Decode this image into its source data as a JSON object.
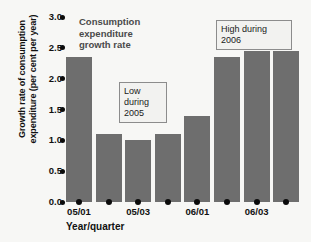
{
  "chart_data": {
    "type": "bar",
    "title": "",
    "series_label": "Consumption expenditure growth rate",
    "xlabel": "Year/quarter",
    "ylabel": "Growth rate of consumption expenditure (per cent per year)",
    "categories": [
      "05/01",
      "05/02",
      "05/03",
      "05/04",
      "06/01",
      "06/02",
      "06/03",
      "06/04"
    ],
    "tick_labels_shown": [
      "05/01",
      "05/03",
      "06/01",
      "06/03"
    ],
    "values": [
      2.35,
      1.1,
      1.0,
      1.1,
      1.4,
      2.35,
      2.45,
      2.45
    ],
    "ylim": [
      0.0,
      3.0
    ],
    "ytick_labels": [
      "3.0",
      "2.5",
      "2.0",
      "1.5",
      "1.0",
      "0.5",
      "0.0"
    ],
    "ytick_values": [
      3.0,
      2.5,
      2.0,
      1.5,
      1.0,
      0.5,
      0.0
    ],
    "grid": false,
    "legend": "none",
    "bar_color": "#6e6e6e",
    "background_color": "#f7f7f5",
    "annotations": [
      {
        "id": "low",
        "text_line1": "Low",
        "text_line2": "during",
        "text_line3": "2005"
      },
      {
        "id": "high",
        "text_line1": "High during",
        "text_line2": "2006"
      }
    ]
  },
  "labels": {
    "y_axis_title": "Growth rate of consumption expenditure (per cent per year)",
    "x_axis_title": "Year/quarter",
    "series_title": "Consumption expenditure growth rate",
    "callout_low": "Low during 2005",
    "callout_high": "High during 2006"
  }
}
